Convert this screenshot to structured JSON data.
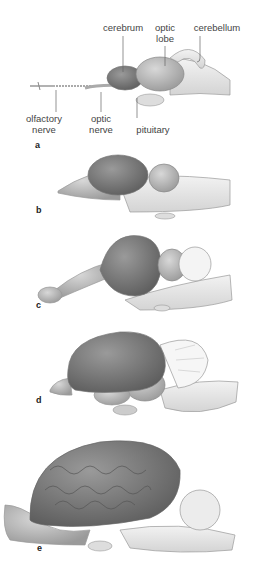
{
  "figure": {
    "panels": [
      {
        "id": "a",
        "label": "a"
      },
      {
        "id": "b",
        "label": "b"
      },
      {
        "id": "c",
        "label": "c"
      },
      {
        "id": "d",
        "label": "d"
      },
      {
        "id": "e",
        "label": "e"
      }
    ],
    "callouts": {
      "cerebrum": "cerebrum",
      "optic_lobe_1": "optic",
      "optic_lobe_2": "lobe",
      "cerebellum": "cerebellum",
      "olfactory_nerve_1": "olfactory",
      "olfactory_nerve_2": "nerve",
      "optic_nerve_1": "optic",
      "optic_nerve_2": "nerve",
      "pituitary": "pituitary"
    },
    "colors": {
      "cerebrum_shade": "#7a7a7a",
      "outline": "#999999",
      "light_tissue": "#e8e8e8",
      "label_text": "#444444"
    }
  }
}
